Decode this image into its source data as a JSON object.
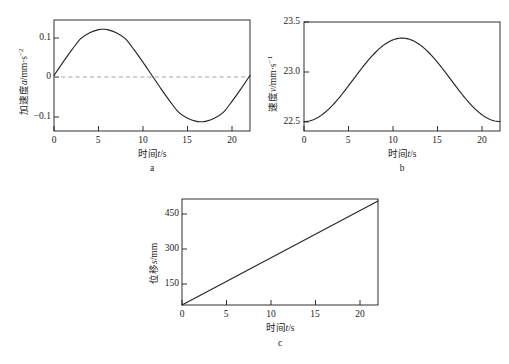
{
  "figure": {
    "caption_a": "a",
    "caption_b": "b",
    "caption_c": "c",
    "axis_color": "#1a1a1a",
    "curve_color": "#262626",
    "zero_line_color": "#9b9b9b",
    "background": "#ffffff"
  },
  "panel_a": {
    "ylabel_prefix": "加速度",
    "ylabel_symbol": "a",
    "ylabel_unit": "/mm·s",
    "ylabel_exp": "−2",
    "xlabel_prefix": "时间",
    "xlabel_symbol": "t",
    "xlabel_unit": "/s",
    "yticks": [
      "0.1",
      "0",
      "−0.1"
    ],
    "xticks": [
      "0",
      "5",
      "10",
      "15",
      "20"
    ]
  },
  "panel_b": {
    "ylabel_prefix": "速度",
    "ylabel_symbol": "v",
    "ylabel_unit": "/mm·s",
    "ylabel_exp": "−1",
    "xlabel_prefix": "时间",
    "xlabel_symbol": "t",
    "xlabel_unit": "/s",
    "yticks": [
      "23.5",
      "23.0",
      "22.5"
    ],
    "xticks": [
      "0",
      "5",
      "10",
      "15",
      "20"
    ]
  },
  "panel_c": {
    "ylabel_prefix": "位移",
    "ylabel_symbol": "s",
    "ylabel_unit": "/mm",
    "xlabel_prefix": "时间",
    "xlabel_symbol": "t",
    "xlabel_unit": "/s",
    "yticks": [
      "450",
      "300",
      "150",
      "0"
    ],
    "xticks": [
      "0",
      "5",
      "10",
      "15",
      "20"
    ]
  },
  "chart_data": [
    {
      "type": "line",
      "panel": "a",
      "title": "",
      "xlabel": "时间t/s",
      "ylabel": "加速度a/mm·s⁻²",
      "xlim": [
        0,
        22
      ],
      "ylim": [
        -0.15,
        0.15
      ],
      "xticks": [
        0,
        5,
        10,
        15,
        20
      ],
      "yticks": [
        0.1,
        0,
        -0.1
      ],
      "grid": false,
      "legend": "none",
      "annotations": [
        "dashed horizontal reference line at y = 0"
      ],
      "description": "One full sine period: a(t) = 0.125 * sin(2*pi*t/22)",
      "x": [
        0,
        1,
        2,
        3,
        4,
        5,
        5.5,
        6,
        7,
        8,
        9,
        10,
        11,
        12,
        13,
        14,
        15,
        16,
        16.5,
        17,
        18,
        19,
        20,
        21,
        22
      ],
      "y": [
        0,
        0.0354,
        0.0692,
        0.0998,
        0.1154,
        0.124,
        0.125,
        0.124,
        0.1154,
        0.0998,
        0.0692,
        0.0354,
        0,
        -0.0354,
        -0.0692,
        -0.0998,
        -0.1154,
        -0.124,
        -0.125,
        -0.124,
        -0.1154,
        -0.0998,
        -0.0692,
        -0.0354,
        0
      ]
    },
    {
      "type": "line",
      "panel": "b",
      "title": "",
      "xlabel": "时间t/s",
      "ylabel": "速度v/mm·s⁻¹",
      "xlim": [
        0,
        22
      ],
      "ylim": [
        22.4,
        23.55
      ],
      "xticks": [
        0,
        5,
        10,
        15,
        20
      ],
      "yticks": [
        23.5,
        23.0,
        22.5
      ],
      "grid": false,
      "legend": "none",
      "description": "Raised-cosine: v(t) = 22.5 + 0.4375*(1 - cos(2*pi*t/22)), peak 23.38 near t = 11",
      "x": [
        0,
        1,
        2,
        3,
        4,
        5,
        6,
        7,
        8,
        9,
        10,
        11,
        12,
        13,
        14,
        15,
        16,
        17,
        18,
        19,
        20,
        21,
        22
      ],
      "y": [
        22.5,
        22.518,
        22.571,
        22.657,
        22.772,
        22.908,
        23.057,
        23.209,
        23.353,
        23.479,
        23.57,
        23.375,
        23.57,
        23.479,
        23.353,
        23.209,
        23.057,
        22.908,
        22.772,
        22.657,
        22.571,
        22.518,
        22.5
      ]
    },
    {
      "type": "line",
      "panel": "c",
      "title": "",
      "xlabel": "时间t/s",
      "ylabel": "位移s/mm",
      "xlim": [
        0,
        22
      ],
      "ylim": [
        0,
        520
      ],
      "xticks": [
        0,
        5,
        10,
        15,
        20
      ],
      "yticks": [
        0,
        150,
        300,
        450
      ],
      "grid": false,
      "legend": "none",
      "description": "Nearly linear displacement ramp from 0 to about 510 mm over 22 s",
      "x": [
        0,
        2,
        4,
        6,
        8,
        10,
        11,
        12,
        14,
        16,
        18,
        20,
        22
      ],
      "y": [
        0,
        45,
        92,
        139,
        187,
        233,
        255,
        278,
        324,
        371,
        418,
        464,
        510
      ]
    }
  ]
}
